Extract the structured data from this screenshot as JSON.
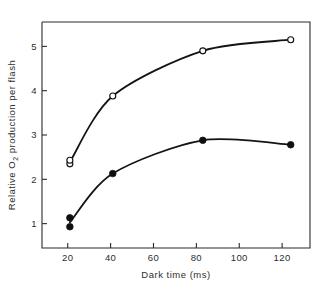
{
  "chart_data": {
    "type": "line",
    "title": "",
    "subtitle": "",
    "xlabel": "Dark time (ms)",
    "xlabel_plain": "Dark time (ms)",
    "ylabel": "Relative O2 production per flash",
    "ylabel_parts": {
      "before": "Relative O",
      "subscript": "2",
      "after": " production per flash"
    },
    "xlim": [
      8,
      133
    ],
    "ylim": [
      0.45,
      5.55
    ],
    "xticks": [
      20,
      40,
      60,
      80,
      100,
      120
    ],
    "xtick_labels": [
      "20",
      "40",
      "60",
      "80",
      "100",
      "120"
    ],
    "yticks": [
      1,
      2,
      3,
      4,
      5
    ],
    "ytick_labels": [
      "1",
      "2",
      "3",
      "4",
      "5"
    ],
    "grid": false,
    "legend": "none",
    "frame": "box",
    "series": [
      {
        "name": "open-circles",
        "marker": "open-circle",
        "x": [
          21,
          21,
          41,
          83,
          124
        ],
        "values": [
          2.35,
          2.43,
          3.88,
          4.9,
          5.15
        ]
      },
      {
        "name": "filled-circles",
        "marker": "filled-circle",
        "x": [
          21,
          21,
          41,
          83,
          124
        ],
        "values": [
          0.93,
          1.13,
          2.13,
          2.88,
          2.78
        ]
      }
    ],
    "annotations": []
  },
  "colors": {
    "axis": "#2b2b2b",
    "curve": "#141414",
    "marker_fill": "#101010",
    "marker_open_fill": "#ffffff",
    "background": "#ffffff"
  }
}
